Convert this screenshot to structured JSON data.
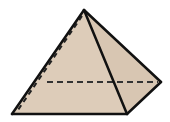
{
  "diagram": {
    "colors": {
      "background": "#ffffff",
      "fill": "#ddccb9",
      "fill_right_face": "#d8c6b2",
      "edge": "#111111"
    },
    "vertices": {
      "apex": [
        84,
        10
      ],
      "front_left": [
        12,
        114
      ],
      "front_right": [
        127,
        114
      ],
      "back_right": [
        161,
        82
      ],
      "back_left": [
        47,
        82
      ]
    },
    "solid_edges": [
      [
        "apex",
        "front_left"
      ],
      [
        "apex",
        "front_right"
      ],
      [
        "apex",
        "back_right"
      ],
      [
        "front_left",
        "front_right"
      ],
      [
        "front_right",
        "back_right"
      ]
    ],
    "hidden_edges": [
      [
        "apex",
        "back_left"
      ],
      [
        "back_left",
        "back_right"
      ],
      [
        "back_left",
        "front_left"
      ]
    ]
  }
}
